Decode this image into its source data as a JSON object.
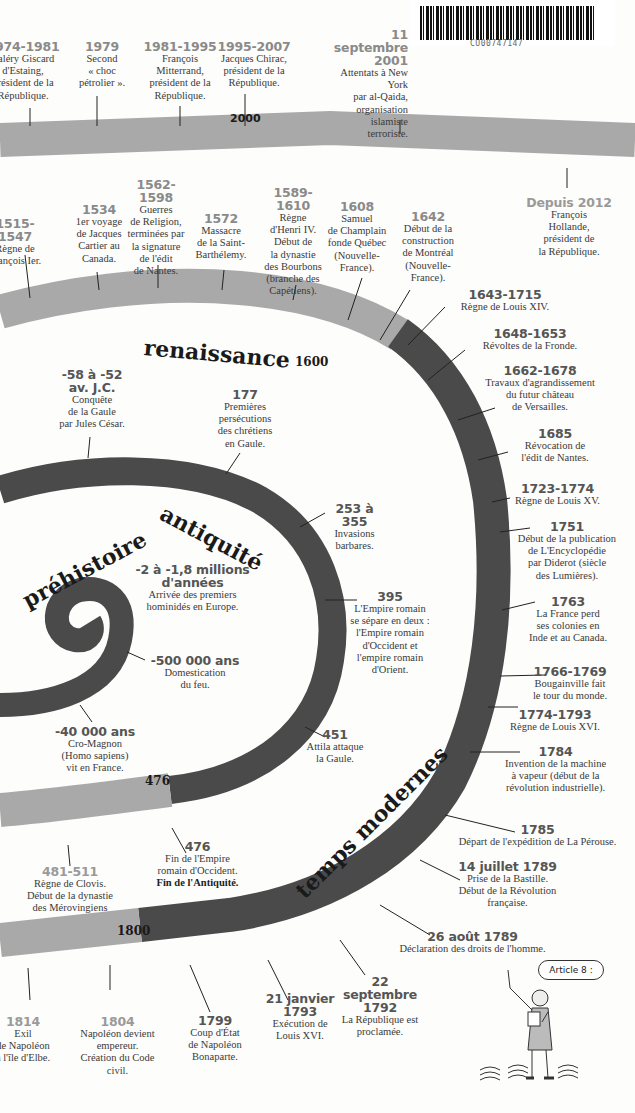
{
  "colors": {
    "dark_band": "#4a4a4a",
    "light_band": "#a9a9a9",
    "date_text": "#555555",
    "light_date_text": "#9a9a9a"
  },
  "eras": {
    "prehistoire": "préhistoire",
    "antiquite": "antiquité",
    "renaissance": "renaissance",
    "temps_modernes": "temps modernes"
  },
  "markers": {
    "m2000": "2000",
    "m1600": "1600",
    "m476": "476",
    "m1800": "1800"
  },
  "barcode": {
    "code": "CU00747147"
  },
  "illustration": {
    "speech": "Article 8 :"
  },
  "events_top": [
    {
      "date": "1974-1981",
      "text": "Valéry Giscard\nd'Estaing,\nprésident de la\nRépublique."
    },
    {
      "date": "1979",
      "text": "Second\n« choc\npétrolier »."
    },
    {
      "date": "1981-1995",
      "text": "François\nMitterrand,\nprésident de la\nRépublique."
    },
    {
      "date": "1995-2007",
      "text": "Jacques Chirac,\nprésident de la\nRépublique."
    },
    {
      "date": "11 septembre\n2001",
      "text": "Attentats à New York\npar al-Qaida,\norganisation islamiste\nterroriste."
    },
    {
      "date": "Depuis 2012",
      "text": "François\nHollande,\nprésident de\nla République."
    }
  ],
  "events_renaissance": [
    {
      "date": "1515-1547",
      "text": "Règne de\nFrançois Ier."
    },
    {
      "date": "1534",
      "text": "1er voyage\nde Jacques\nCartier au\nCanada."
    },
    {
      "date": "1562-1598",
      "text": "Guerres\nde Religion,\nterminées par\nla signature\nde l'édit\nde Nantes."
    },
    {
      "date": "1572",
      "text": "Massacre\nde la Saint-\nBarthélemy."
    },
    {
      "date": "1589-1610",
      "text": "Règne\nd'Henri IV.\nDébut de\nla dynastie\ndes Bourbons\n(branche des\nCapétiens)."
    },
    {
      "date": "1608",
      "text": "Samuel\nde Champlain\nfonde Québec\n(Nouvelle-\nFrance)."
    },
    {
      "date": "1642",
      "text": "Début de la\nconstruction\nde Montréal\n(Nouvelle-\nFrance)."
    }
  ],
  "events_right": [
    {
      "date": "1643-1715",
      "text": "Règne de Louis XIV."
    },
    {
      "date": "1648-1653",
      "text": "Révoltes de la Fronde."
    },
    {
      "date": "1662-1678",
      "text": "Travaux d'agrandissement\ndu futur château\nde Versailles."
    },
    {
      "date": "1685",
      "text": "Révocation de\nl'édit de Nantes."
    },
    {
      "date": "1723-1774",
      "text": "Règne de Louis XV."
    },
    {
      "date": "1751",
      "text": "Début de la publication\nde L'Encyclopédie\npar Diderot (siècle\ndes Lumières)."
    },
    {
      "date": "1763",
      "text": "La France perd\nses colonies en\nInde et au Canada."
    },
    {
      "date": "1766-1769",
      "text": "Bougainville fait\nle tour du monde."
    },
    {
      "date": "1774-1793",
      "text": "Règne de Louis XVI."
    },
    {
      "date": "1784",
      "text": "Invention de la machine\nà vapeur (début de la\nrévolution industrielle)."
    },
    {
      "date": "1785",
      "text": "Départ de l'expédition de La Pérouse."
    },
    {
      "date": "14 juillet 1789",
      "text": "Prise de la Bastille.\nDébut de la Révolution\nfrançaise."
    },
    {
      "date": "26 août 1789",
      "text": "Déclaration des droits de l'homme."
    }
  ],
  "events_inner": [
    {
      "date": "-58 à -52\nav. J.C.",
      "text": "Conquête\nde la Gaule\npar Jules César."
    },
    {
      "date": "177",
      "text": "Premières\npersécutions\ndes chrétiens\nen Gaule."
    },
    {
      "date": "253 à 355",
      "text": "Invasions\nbarbares."
    },
    {
      "date": "-2 à -1,8 millions\nd'années",
      "text": "Arrivée des premiers\nhominidés en Europe."
    },
    {
      "date": "395",
      "text": "L'Empire romain\nse sépare en deux :\nl'Empire romain\nd'Occident et\nl'empire romain\nd'Orient."
    },
    {
      "date": "-500 000 ans",
      "text": "Domestication\ndu feu."
    },
    {
      "date": "-40 000 ans",
      "text": "Cro-Magnon\n(Homo sapiens)\nvit en France."
    },
    {
      "date": "451",
      "text": "Attila attaque\nla Gaule."
    },
    {
      "date": "476",
      "text": "Fin de l'Empire\nromain d'Occident.",
      "bold": "Fin de l'Antiquité."
    },
    {
      "date": "481-511",
      "text": "Règne de Clovis.\nDébut de la dynastie\ndes Mérovingiens"
    }
  ],
  "events_bottom": [
    {
      "date": "1814",
      "text": "Exil\nde Napoléon\nà l'île d'Elbe."
    },
    {
      "date": "1804",
      "text": "Napoléon devient\nempereur.\nCréation du Code\ncivil."
    },
    {
      "date": "1799",
      "text": "Coup d'État\nde Napoléon\nBonaparte."
    },
    {
      "date": "21 janvier\n1793",
      "text": "Exécution de\nLouis XVI."
    },
    {
      "date": "22 septembre\n1792",
      "text": "La République est\nproclamée."
    }
  ]
}
